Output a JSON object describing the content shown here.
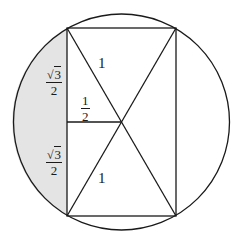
{
  "diagram": {
    "colors": {
      "stroke": "#1a1a1a",
      "shade": "#e4e4e4",
      "background": "#ffffff"
    },
    "circle": {
      "cx": 121.5,
      "cy": 122,
      "r": 108
    },
    "rectangle": {
      "x1": 67,
      "y1": 28,
      "x2": 176,
      "y2": 216
    },
    "center_point": {
      "x": 121.5,
      "y": 122
    },
    "labels": {
      "upper_diagonal_segment": "1",
      "lower_diagonal_segment": "1",
      "half_segment": {
        "numerator": "1",
        "denominator": "2"
      },
      "upper_side_half": {
        "radical": "√",
        "radicand": "3",
        "denominator": "2"
      },
      "lower_side_half": {
        "radical": "√",
        "radicand": "3",
        "denominator": "2"
      }
    }
  }
}
